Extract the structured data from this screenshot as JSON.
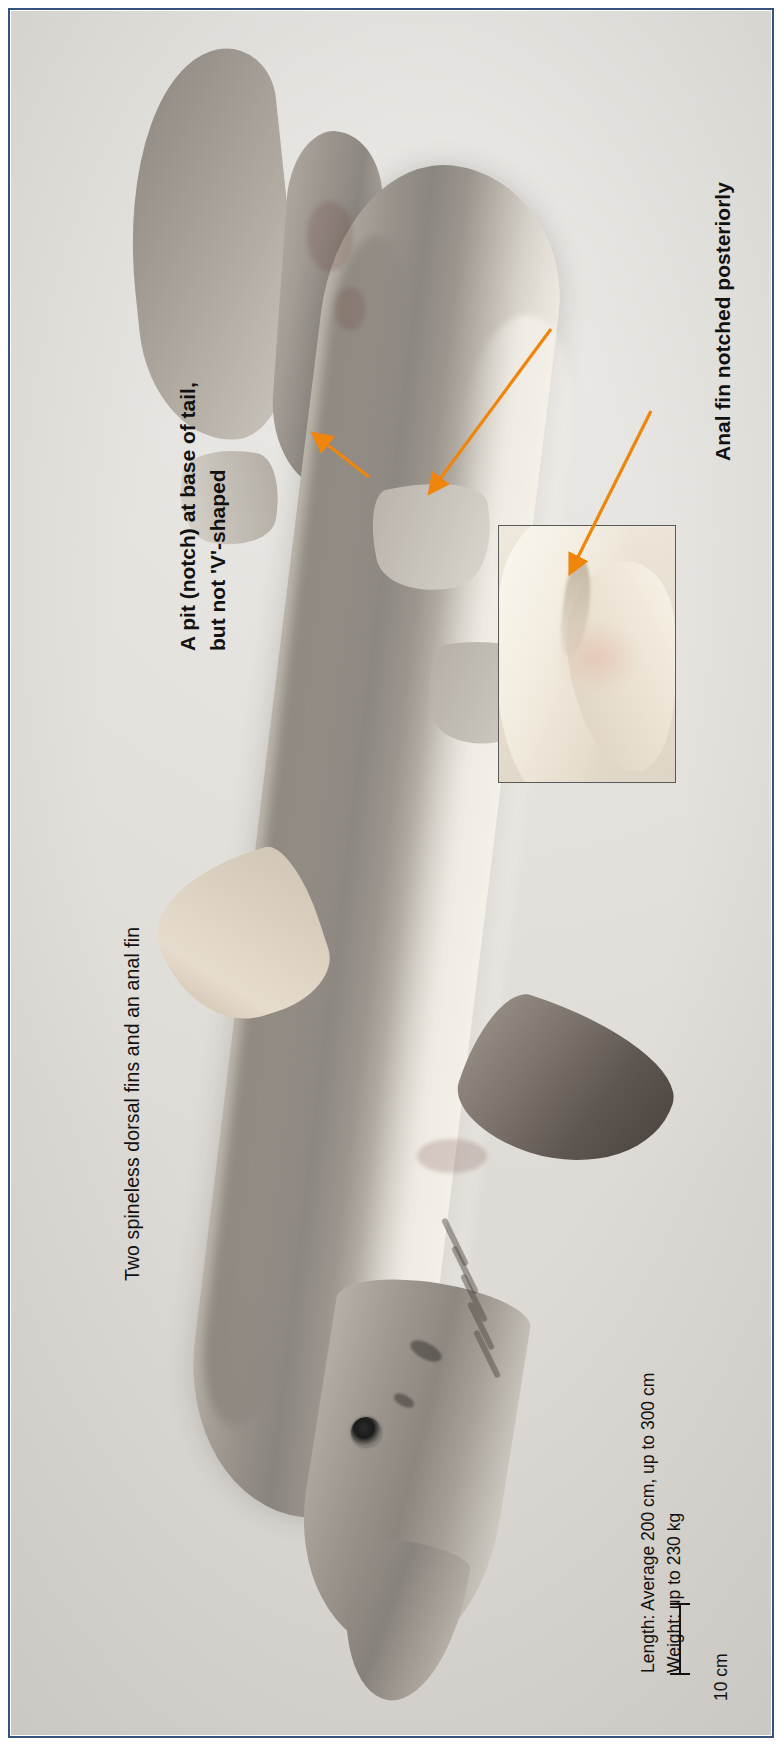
{
  "plate": {
    "kind": "annotated-specimen-photograph",
    "subject": "shark-whole-body-dorsal-view",
    "border_color": "#35537e",
    "background_color": "#ece9e4",
    "arrow_color": "#f0850c"
  },
  "annotations": {
    "two_dorsal": "Two spineless dorsal fins and an anal fin",
    "pit_notch_line1": "A pit (notch) at base of tail,",
    "pit_notch_line2": "but not 'V'-shaped",
    "anal_fin": "Anal fin notched posteriorly",
    "length": "Length: Average 200 cm, up to 300 cm",
    "weight": "Weight: up to 230 kg"
  },
  "scalebar": {
    "label": "10 cm"
  },
  "inset": {
    "caption": "close-up of anal fin posterior notch"
  },
  "arrows": [
    {
      "name": "arrow-to-tail-pit",
      "from": [
        310,
        458
      ],
      "to": [
        318,
        430
      ]
    },
    {
      "name": "arrow-to-anal-fin-on-specimen",
      "from": [
        463,
        460
      ],
      "to": [
        430,
        492
      ]
    },
    {
      "name": "arrow-to-inset-notch",
      "from": [
        606,
        366
      ],
      "to": [
        556,
        556
      ]
    }
  ]
}
